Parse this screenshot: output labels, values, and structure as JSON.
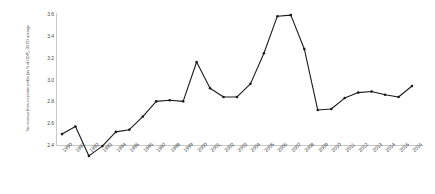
{
  "chart_data": {
    "type": "line",
    "title": "",
    "xlabel": "",
    "ylabel": "Tax revenue from corporate profits (as % of GDP), OECD average",
    "ylim": [
      2.4,
      3.6
    ],
    "yticks": [
      "3.6",
      "3.4",
      "3.2",
      "3.0",
      "2.8",
      "2.6",
      "2.4"
    ],
    "ytick_values": [
      3.6,
      3.4,
      3.2,
      3.0,
      2.8,
      2.6,
      2.4
    ],
    "grid": false,
    "legend": "none",
    "marker": "circle",
    "line_color": "#1a1a1a",
    "axis_color": "#c9c9c9",
    "categories": [
      "1990",
      "1991",
      "1992",
      "1993",
      "1994",
      "1995",
      "1996",
      "1997",
      "1998",
      "1999",
      "2000",
      "2001",
      "2002",
      "2003",
      "2004",
      "2005",
      "2006",
      "2007",
      "2008",
      "2009",
      "2010",
      "2011",
      "2012",
      "2013",
      "2014",
      "2015",
      "2016"
    ],
    "values": [
      2.5,
      2.57,
      2.3,
      2.39,
      2.52,
      2.54,
      2.66,
      2.8,
      2.81,
      2.8,
      3.16,
      2.92,
      2.84,
      2.84,
      2.96,
      3.24,
      3.58,
      3.59,
      3.28,
      2.72,
      2.73,
      2.83,
      2.88,
      2.89,
      2.86,
      2.84,
      2.94
    ]
  }
}
